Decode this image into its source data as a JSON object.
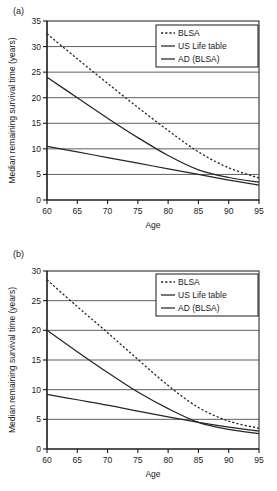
{
  "figure": {
    "panels": [
      {
        "id": "a",
        "label": "(a)",
        "xlabel": "Age",
        "ylabel": "Median remaining survival time (years)"
      },
      {
        "id": "b",
        "label": "(b)",
        "xlabel": "Age",
        "ylabel": "Median remaining survival time (years)"
      }
    ]
  },
  "chart_data": [
    {
      "type": "line",
      "panel": "a",
      "title": "",
      "xlabel": "Age",
      "ylabel": "Median remaining survival time (years)",
      "xlim": [
        60,
        95
      ],
      "ylim": [
        0,
        35
      ],
      "xticks": [
        60,
        65,
        70,
        75,
        80,
        85,
        90,
        95
      ],
      "yticks": [
        0,
        5,
        10,
        15,
        20,
        25,
        30,
        35
      ],
      "grid": "horizontal",
      "legend_position": "upper-right",
      "series": [
        {
          "name": "BLSA",
          "style": "dashed",
          "x": [
            60,
            65,
            70,
            75,
            80,
            85,
            90,
            95
          ],
          "values": [
            32.5,
            27.6,
            22.8,
            18.1,
            13.6,
            9.4,
            6.3,
            4.3
          ]
        },
        {
          "name": "US Life table",
          "style": "solid",
          "x": [
            60,
            65,
            70,
            75,
            80,
            85,
            90,
            95
          ],
          "values": [
            24.0,
            20.0,
            16.0,
            12.2,
            8.7,
            5.9,
            4.4,
            3.5
          ]
        },
        {
          "name": "AD (BLSA)",
          "style": "solid",
          "x": [
            60,
            65,
            70,
            75,
            80,
            85,
            90,
            95
          ],
          "values": [
            10.5,
            9.4,
            8.3,
            7.2,
            6.1,
            5.0,
            3.9,
            2.9
          ]
        }
      ]
    },
    {
      "type": "line",
      "panel": "b",
      "title": "",
      "xlabel": "Age",
      "ylabel": "Median remaining survival time (years)",
      "xlim": [
        60,
        95
      ],
      "ylim": [
        0,
        30
      ],
      "xticks": [
        60,
        65,
        70,
        75,
        80,
        85,
        90,
        95
      ],
      "yticks": [
        0,
        5,
        10,
        15,
        20,
        25,
        30
      ],
      "grid": "horizontal",
      "legend_position": "upper-right",
      "series": [
        {
          "name": "BLSA",
          "style": "dashed",
          "x": [
            60,
            65,
            70,
            75,
            80,
            85,
            90,
            95
          ],
          "values": [
            28.5,
            24.0,
            19.6,
            15.1,
            10.7,
            7.0,
            4.7,
            3.5
          ]
        },
        {
          "name": "US Life table",
          "style": "solid",
          "x": [
            60,
            65,
            70,
            75,
            80,
            85,
            90,
            95
          ],
          "values": [
            20.0,
            16.4,
            12.9,
            9.6,
            6.8,
            4.5,
            3.3,
            2.6
          ]
        },
        {
          "name": "AD (BLSA)",
          "style": "solid",
          "x": [
            60,
            65,
            70,
            75,
            80,
            85,
            90,
            95
          ],
          "values": [
            9.2,
            8.3,
            7.4,
            6.4,
            5.4,
            4.5,
            3.7,
            3.0
          ]
        }
      ]
    }
  ],
  "legend": {
    "items": [
      {
        "label": "BLSA",
        "style": "dashed"
      },
      {
        "label": "US Life table",
        "style": "solid"
      },
      {
        "label": "AD (BLSA)",
        "style": "solid"
      }
    ]
  },
  "colors": {
    "axis": "#1a1a1a",
    "grid": "#4d4d4d",
    "series": "#262626",
    "background": "#ffffff"
  }
}
